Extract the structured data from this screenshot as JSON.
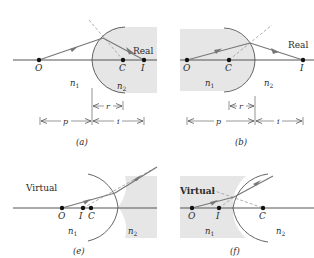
{
  "colors": {
    "shade": "#e6e6e6",
    "axis": "#555555",
    "ray": "#777777",
    "dashed": "#999999",
    "point": "#111111",
    "text": "#2a2a2a"
  },
  "panels": [
    {
      "id": "a",
      "caption": "(a)",
      "image_type": "Real",
      "points": {
        "O": "O",
        "C": "C",
        "I": "I"
      },
      "media": {
        "n1": "n",
        "n1_sub": "1",
        "n2": "n",
        "n2_sub": "2"
      },
      "dimensions": {
        "r": "r",
        "p": "p",
        "i": "i"
      }
    },
    {
      "id": "b",
      "caption": "(b)",
      "image_type": "Real",
      "points": {
        "O": "O",
        "C": "C",
        "I": "I"
      },
      "media": {
        "n1": "n",
        "n1_sub": "1",
        "n2": "n",
        "n2_sub": "2"
      },
      "dimensions": {
        "r": "r",
        "p": "p",
        "i": "i"
      }
    },
    {
      "id": "e",
      "caption": "(e)",
      "image_type": "Virtual",
      "points": {
        "O": "O",
        "I": "I",
        "C": "C"
      },
      "media": {
        "n1": "n",
        "n1_sub": "1",
        "n2": "n",
        "n2_sub": "2"
      }
    },
    {
      "id": "f",
      "caption": "(f)",
      "image_type": "Virtual",
      "points": {
        "O": "O",
        "I": "I",
        "C": "C"
      },
      "media": {
        "n1": "n",
        "n1_sub": "1",
        "n2": "n",
        "n2_sub": "2"
      }
    }
  ]
}
